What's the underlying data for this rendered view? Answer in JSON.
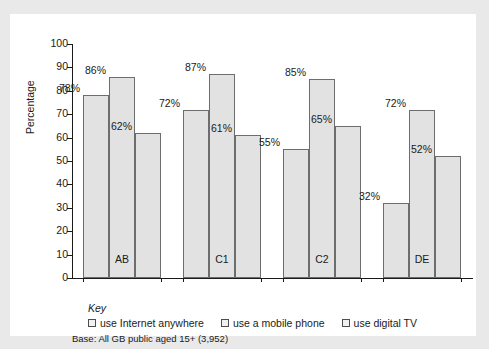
{
  "chart_data": {
    "type": "bar",
    "title": "",
    "xlabel": "",
    "ylabel": "Percentage",
    "ylim": [
      0,
      100
    ],
    "ytick_step": 10,
    "yticks": [
      100,
      90,
      80,
      70,
      60,
      50,
      40,
      30,
      20,
      10,
      0
    ],
    "grid": false,
    "legend_position": "bottom",
    "categories": [
      "AB",
      "C1",
      "C2",
      "DE"
    ],
    "series": [
      {
        "name": "use Internet anywhere",
        "values": [
          78,
          72,
          55,
          32
        ],
        "labels": [
          "78%",
          "72%",
          "55%",
          "32%"
        ]
      },
      {
        "name": "use a mobile phone",
        "values": [
          86,
          87,
          85,
          72
        ],
        "labels": [
          "86%",
          "87%",
          "85%",
          "72%"
        ]
      },
      {
        "name": "use digital TV",
        "values": [
          62,
          61,
          65,
          52
        ],
        "labels": [
          "62%",
          "61%",
          "65%",
          "52%"
        ]
      }
    ],
    "bar_fill_color": "#e2e2e2",
    "bar_edge_color": "#6d6d6d",
    "axis_color": "#1a1a1a"
  },
  "key": {
    "title": "Key",
    "items": [
      {
        "label": "use Internet anywhere"
      },
      {
        "label": "use a mobile phone"
      },
      {
        "label": "use digital TV"
      }
    ]
  },
  "base_note": "Base: All GB public aged 15+ (3,952)"
}
